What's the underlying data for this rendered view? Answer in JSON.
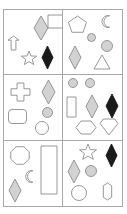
{
  "figure": {
    "title": "",
    "kind": "shape-grid",
    "columns": 2,
    "rows": 3,
    "panel_count": 6,
    "colors": {
      "background": "#ffffff",
      "border": "#a8a8a8",
      "outline": "#8c8c8c",
      "gray_fill": "#d2d2d2",
      "black_fill": "#1a1a1a",
      "white_fill": "#ffffff"
    }
  },
  "panels": [
    {
      "id": "panel-1",
      "position": "top-left",
      "shape_count": 5,
      "shapes": [
        {
          "name": "diamond",
          "fill": "gray",
          "x": 30,
          "y": 6,
          "w": 14,
          "h": 24,
          "rot": 0
        },
        {
          "name": "square",
          "fill": "white",
          "x": 44,
          "y": 5,
          "w": 16,
          "h": 13,
          "rot": 0
        },
        {
          "name": "arrow-up-banner",
          "fill": "white",
          "x": 4,
          "y": 26,
          "w": 11,
          "h": 14,
          "rot": 0
        },
        {
          "name": "star",
          "fill": "white",
          "x": 17,
          "y": 41,
          "w": 16,
          "h": 15,
          "rot": 0
        },
        {
          "name": "diamond",
          "fill": "black",
          "x": 38,
          "y": 36,
          "w": 11,
          "h": 23,
          "rot": 0
        }
      ]
    },
    {
      "id": "panel-2",
      "position": "top-right",
      "shape_count": 6,
      "shapes": [
        {
          "name": "pentagon",
          "fill": "white",
          "x": 5,
          "y": 6,
          "w": 19,
          "h": 18,
          "rot": 0
        },
        {
          "name": "crescent",
          "fill": "white",
          "x": 36,
          "y": 5,
          "w": 13,
          "h": 13,
          "rot": 0
        },
        {
          "name": "circle",
          "fill": "gray",
          "x": 24,
          "y": 23,
          "w": 9,
          "h": 9,
          "rot": 0
        },
        {
          "name": "circle",
          "fill": "gray",
          "x": 38,
          "y": 30,
          "w": 12,
          "h": 12,
          "rot": 0
        },
        {
          "name": "diamond",
          "fill": "gray",
          "x": 6,
          "y": 36,
          "w": 12,
          "h": 23,
          "rot": 0
        },
        {
          "name": "triangle",
          "fill": "white",
          "x": 31,
          "y": 45,
          "w": 16,
          "h": 14,
          "rot": 0
        }
      ]
    },
    {
      "id": "panel-3",
      "position": "middle-left",
      "shape_count": 5,
      "shapes": [
        {
          "name": "cross",
          "fill": "white",
          "x": 7,
          "y": 8,
          "w": 19,
          "h": 18,
          "rot": 0
        },
        {
          "name": "diamond",
          "fill": "gray",
          "x": 38,
          "y": 5,
          "w": 13,
          "h": 24,
          "rot": 0
        },
        {
          "name": "circle",
          "fill": "gray",
          "x": 38,
          "y": 32,
          "w": 11,
          "h": 11,
          "rot": 0
        },
        {
          "name": "rounded-rectangle",
          "fill": "white",
          "x": 4,
          "y": 34,
          "w": 19,
          "h": 15,
          "rot": 0
        },
        {
          "name": "circle",
          "fill": "white",
          "x": 31,
          "y": 46,
          "w": 14,
          "h": 14,
          "rot": 0
        }
      ]
    },
    {
      "id": "panel-4",
      "position": "middle-right",
      "shape_count": 7,
      "shapes": [
        {
          "name": "circle",
          "fill": "gray",
          "x": 5,
          "y": 3,
          "w": 10,
          "h": 10,
          "rot": 0
        },
        {
          "name": "circle",
          "fill": "gray",
          "x": 22,
          "y": 3,
          "w": 10,
          "h": 10,
          "rot": 0
        },
        {
          "name": "rectangle",
          "fill": "white",
          "x": 4,
          "y": 22,
          "w": 9,
          "h": 20,
          "rot": 0
        },
        {
          "name": "diamond",
          "fill": "gray",
          "x": 23,
          "y": 20,
          "w": 12,
          "h": 23,
          "rot": 0
        },
        {
          "name": "diamond",
          "fill": "black",
          "x": 43,
          "y": 19,
          "w": 12,
          "h": 24,
          "rot": 0
        },
        {
          "name": "hexagon",
          "fill": "white",
          "x": 13,
          "y": 45,
          "w": 20,
          "h": 15,
          "rot": 0
        },
        {
          "name": "heart",
          "fill": "white",
          "x": 37,
          "y": 44,
          "w": 18,
          "h": 16,
          "rot": 0
        }
      ]
    },
    {
      "id": "panel-5",
      "position": "bottom-left",
      "shape_count": 4,
      "shapes": [
        {
          "name": "octagon",
          "fill": "white",
          "x": 6,
          "y": 5,
          "w": 20,
          "h": 19,
          "rot": 0
        },
        {
          "name": "rectangle",
          "fill": "white",
          "x": 37,
          "y": 5,
          "w": 16,
          "h": 48,
          "rot": 0
        },
        {
          "name": "crescent",
          "fill": "white",
          "x": 19,
          "y": 29,
          "w": 12,
          "h": 13,
          "rot": 0
        },
        {
          "name": "diamond",
          "fill": "gray",
          "x": 5,
          "y": 38,
          "w": 12,
          "h": 23,
          "rot": 0
        }
      ]
    },
    {
      "id": "panel-6",
      "position": "bottom-right",
      "shape_count": 6,
      "shapes": [
        {
          "name": "star",
          "fill": "white",
          "x": 16,
          "y": 3,
          "w": 18,
          "h": 17,
          "rot": 0
        },
        {
          "name": "diamond",
          "fill": "black",
          "x": 43,
          "y": 3,
          "w": 11,
          "h": 23,
          "rot": 0
        },
        {
          "name": "diamond",
          "fill": "gray",
          "x": 5,
          "y": 19,
          "w": 12,
          "h": 23,
          "rot": 0
        },
        {
          "name": "circle",
          "fill": "gray",
          "x": 22,
          "y": 24,
          "w": 12,
          "h": 12,
          "rot": 0
        },
        {
          "name": "circle",
          "fill": "white",
          "x": 8,
          "y": 44,
          "w": 16,
          "h": 16,
          "rot": 0
        },
        {
          "name": "i-beam-arrows",
          "fill": "white",
          "x": 35,
          "y": 42,
          "w": 19,
          "h": 17,
          "rot": 0
        }
      ]
    }
  ]
}
